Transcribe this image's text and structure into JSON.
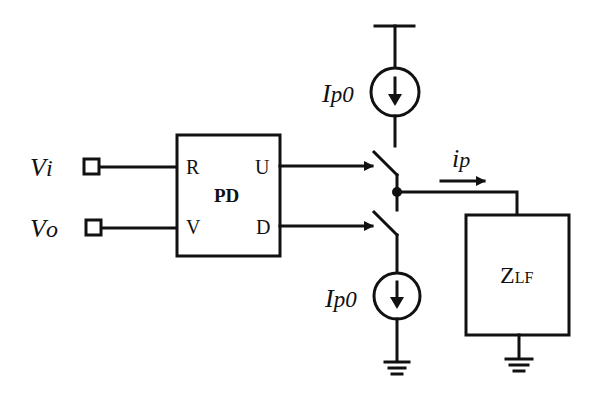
{
  "diagram": {
    "inputs": [
      {
        "id": "vi",
        "label_main": "V",
        "label_sub": "i"
      },
      {
        "id": "vo",
        "label_main": "V",
        "label_sub": "o"
      }
    ],
    "phase_detector": {
      "label": "PD",
      "ports": {
        "r": "R",
        "v": "V",
        "u": "U",
        "d": "D"
      }
    },
    "current_sources": [
      {
        "id": "up-source",
        "label_main": "I",
        "label_sub": "p0"
      },
      {
        "id": "down-source",
        "label_main": "I",
        "label_sub": "p0"
      }
    ],
    "output_current": {
      "label_main": "i",
      "label_sub": "p"
    },
    "loop_filter": {
      "label_main": "Z",
      "label_sub": "LF"
    },
    "colors": {
      "stroke": "#111111",
      "background": "#ffffff"
    }
  }
}
